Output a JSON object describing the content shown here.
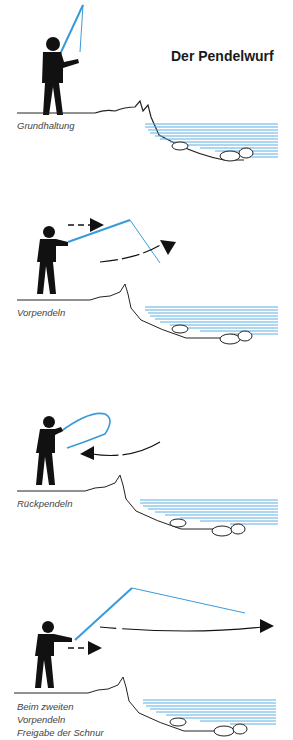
{
  "title": "Der Pendelwurf",
  "colors": {
    "rod": "#3a9ad9",
    "water": "#5aafe0",
    "figure": "#111111"
  },
  "panels": [
    {
      "caption": "Grundhaltung"
    },
    {
      "caption": "Vorpendeln"
    },
    {
      "caption": "Rückpendeln"
    },
    {
      "caption_lines": [
        "Beim zweiten",
        "Vorpendeln",
        "Freigabe der Schnur"
      ]
    }
  ]
}
